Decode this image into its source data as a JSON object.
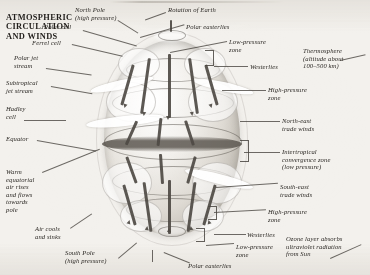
{
  "document": {
    "title_lines": [
      "ATMOSPHERIC",
      "CIRCULATION",
      "AND WINDS"
    ],
    "title_text": "ATMOSPHERIC CIRCULATION AND WINDS",
    "background_color": "#f3f1ed",
    "ink_color": "#2b2824",
    "illustration": "grayscale cutaway globe showing atmospheric circulation cells, jet streams and prevailing surface winds"
  },
  "labels_left": [
    {
      "name": "ferrel-cell",
      "text": "Ferrel cell"
    },
    {
      "name": "polar-jet-stream",
      "text": "Polar jet\nstream"
    },
    {
      "name": "subtropical-jet-stream",
      "text": "Subtropical\njet stream"
    },
    {
      "name": "hadley-cell",
      "text": "Hadley\ncell"
    },
    {
      "name": "equator",
      "text": "Equator"
    },
    {
      "name": "warm-equatorial-air",
      "text": "Warm\nequatorial\nair rises\nand flows\ntowards\npole"
    },
    {
      "name": "air-cools-and-sinks",
      "text": "Air cools\nand sinks"
    }
  ],
  "labels_top": [
    {
      "name": "north-pole",
      "text": "North Pole\n(high pressure)"
    },
    {
      "name": "polar-cell",
      "text": "Polar cell"
    },
    {
      "name": "rotation-of-earth",
      "text": "Rotation of Earth"
    },
    {
      "name": "polar-easterlies-north",
      "text": "Polar easterlies"
    }
  ],
  "labels_right": [
    {
      "name": "low-pressure-zone-north",
      "text": "Low-pressure\nzone"
    },
    {
      "name": "westerlies-north",
      "text": "Westerlies"
    },
    {
      "name": "thermosphere",
      "text": "Thermosphere\n(altitude about\n100–500 km)"
    },
    {
      "name": "high-pressure-zone-north",
      "text": "High-pressure\nzone"
    },
    {
      "name": "north-east-trade-winds",
      "text": "North-east\ntrade winds"
    },
    {
      "name": "intertropical-convergence-zone",
      "text": "Intertropical\nconvergence zone\n(low pressure)"
    },
    {
      "name": "south-east-trade-winds",
      "text": "South-east\ntrade winds"
    },
    {
      "name": "high-pressure-zone-south",
      "text": "High-pressure\nzone"
    },
    {
      "name": "westerlies-south",
      "text": "Westerlies"
    },
    {
      "name": "low-pressure-zone-south",
      "text": "Low-pressure\nzone"
    },
    {
      "name": "ozone-layer",
      "text": "Ozone layer absorbs\nultraviolet radiation\nfrom Sun"
    }
  ],
  "labels_bottom": [
    {
      "name": "south-pole",
      "text": "South Pole\n(high pressure)"
    },
    {
      "name": "polar-easterlies-south",
      "text": "Polar easterlies"
    }
  ]
}
